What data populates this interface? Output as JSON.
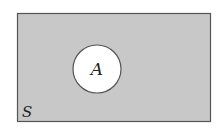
{
  "diagram": {
    "type": "venn",
    "universal_set": {
      "label": "S",
      "fill": "#c8c8c8",
      "stroke": "#555555"
    },
    "sets": [
      {
        "label": "A",
        "fill": "#ffffff",
        "stroke": "#555555"
      }
    ],
    "shaded_region": "complement of A (A')"
  }
}
